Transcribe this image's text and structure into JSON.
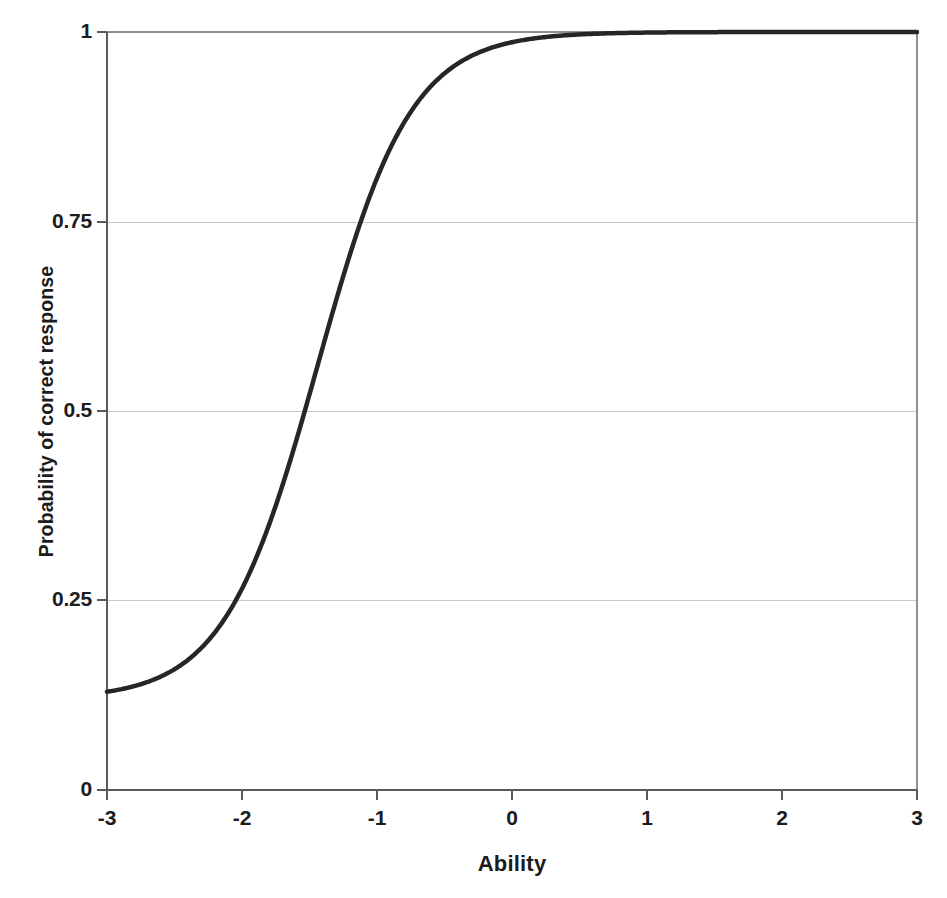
{
  "chart_data": {
    "type": "line",
    "title": "",
    "xlabel": "Ability",
    "ylabel": "Probability of correct response",
    "xlim": [
      -3,
      3
    ],
    "ylim": [
      0,
      1
    ],
    "xticks": [
      "-3",
      "-2",
      "-1",
      "0",
      "1",
      "2",
      "3"
    ],
    "xtick_values": [
      -3,
      -2,
      -1,
      0,
      1,
      2,
      3
    ],
    "yticks": [
      "0",
      "0.25",
      "0.5",
      "0.75",
      "1"
    ],
    "ytick_values": [
      0,
      0.25,
      0.5,
      0.75,
      1
    ],
    "grid": "horizontal",
    "legend": "none",
    "series": [
      {
        "name": "Item characteristic curve",
        "color": "#262626",
        "line_width": 4.5,
        "model": "3-parameter logistic",
        "parameters": {
          "discrimination_a": 1.7,
          "difficulty_b": -1.44,
          "guessing_c": 0.12
        },
        "x": [
          -3.0,
          -2.8,
          -2.6,
          -2.4,
          -2.2,
          -2.0,
          -1.8,
          -1.6,
          -1.4,
          -1.2,
          -1.0,
          -0.8,
          -0.6,
          -0.4,
          -0.2,
          0.0,
          0.2,
          0.4,
          0.6,
          0.8,
          1.0,
          1.2,
          1.4,
          1.6,
          1.8,
          2.0,
          2.2,
          2.4,
          2.6,
          2.8,
          3.0
        ],
        "values": [
          0.12,
          0.135,
          0.155,
          0.181,
          0.216,
          0.259,
          0.314,
          0.38,
          0.456,
          0.537,
          0.619,
          0.697,
          0.765,
          0.821,
          0.865,
          0.899,
          0.925,
          0.944,
          0.958,
          0.969,
          0.977,
          0.983,
          0.987,
          0.99,
          0.993,
          0.995,
          0.996,
          0.997,
          0.998,
          0.998,
          0.999
        ]
      }
    ],
    "annotations": {
      "crossing_p025_at_ability": -2.03,
      "crossing_p050_at_ability": -1.44,
      "crossing_p075_at_ability": -0.94,
      "lower_asymptote": 0.12,
      "upper_asymptote": 1.0
    },
    "colors": {
      "background": "#ffffff",
      "axis": "#5a5a5a",
      "grid": "#c9c9c9",
      "text": "#1c1c1c",
      "curve": "#262626"
    }
  }
}
